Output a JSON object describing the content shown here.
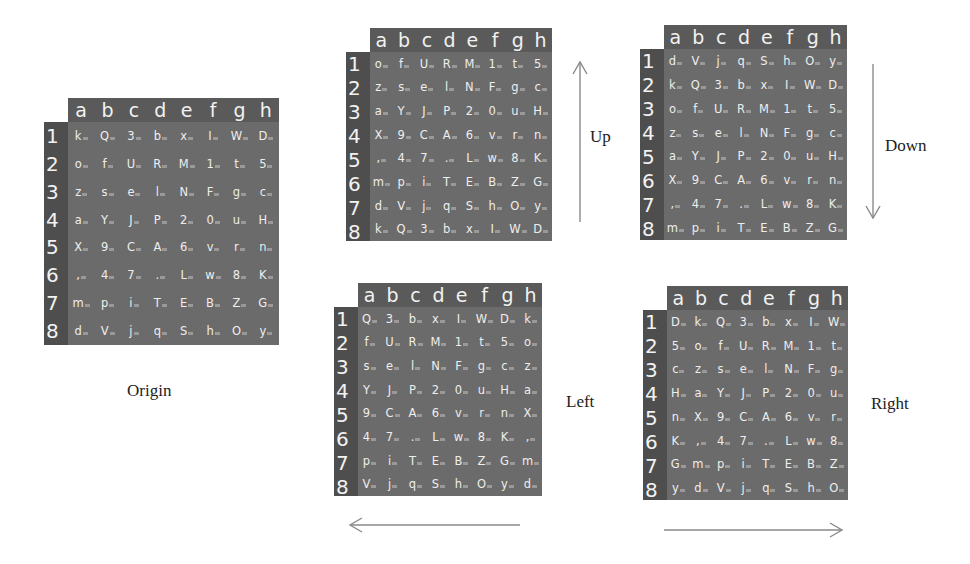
{
  "columns": [
    "a",
    "b",
    "c",
    "d",
    "e",
    "f",
    "g",
    "h"
  ],
  "row_labels": [
    "1",
    "2",
    "3",
    "4",
    "5",
    "6",
    "7",
    "8"
  ],
  "panels": {
    "origin": {
      "label": "Origin",
      "rows": [
        [
          "k",
          "Q",
          "3",
          "b",
          "x",
          "I",
          "W",
          "D"
        ],
        [
          "o",
          "f",
          "U",
          "R",
          "M",
          "1",
          "t",
          "5"
        ],
        [
          "z",
          "s",
          "e",
          "l",
          "N",
          "F",
          "g",
          "c"
        ],
        [
          "a",
          "Y",
          "J",
          "P",
          "2",
          "0",
          "u",
          "H"
        ],
        [
          "X",
          "9",
          "C",
          "A",
          "6",
          "v",
          "r",
          "n"
        ],
        [
          ",",
          "4",
          "7",
          ".",
          "L",
          "w",
          "8",
          "K"
        ],
        [
          "m",
          "p",
          "i",
          "T",
          "E",
          "B",
          "Z",
          "G"
        ],
        [
          "d",
          "V",
          "j",
          "q",
          "S",
          "h",
          "O",
          "y"
        ]
      ]
    },
    "up": {
      "label": "Up",
      "rows": [
        [
          "o",
          "f",
          "U",
          "R",
          "M",
          "1",
          "t",
          "5"
        ],
        [
          "z",
          "s",
          "e",
          "l",
          "N",
          "F",
          "g",
          "c"
        ],
        [
          "a",
          "Y",
          "J",
          "P",
          "2",
          "0",
          "u",
          "H"
        ],
        [
          "X",
          "9",
          "C",
          "A",
          "6",
          "v",
          "r",
          "n"
        ],
        [
          ",",
          "4",
          "7",
          ".",
          "L",
          "w",
          "8",
          "K"
        ],
        [
          "m",
          "p",
          "i",
          "T",
          "E",
          "B",
          "Z",
          "G"
        ],
        [
          "d",
          "V",
          "j",
          "q",
          "S",
          "h",
          "O",
          "y"
        ],
        [
          "k",
          "Q",
          "3",
          "b",
          "x",
          "I",
          "W",
          "D"
        ]
      ]
    },
    "down": {
      "label": "Down",
      "rows": [
        [
          "d",
          "V",
          "j",
          "q",
          "S",
          "h",
          "O",
          "y"
        ],
        [
          "k",
          "Q",
          "3",
          "b",
          "x",
          "I",
          "W",
          "D"
        ],
        [
          "o",
          "f",
          "U",
          "R",
          "M",
          "1",
          "t",
          "5"
        ],
        [
          "z",
          "s",
          "e",
          "l",
          "N",
          "F",
          "g",
          "c"
        ],
        [
          "a",
          "Y",
          "J",
          "P",
          "2",
          "0",
          "u",
          "H"
        ],
        [
          "X",
          "9",
          "C",
          "A",
          "6",
          "v",
          "r",
          "n"
        ],
        [
          ",",
          "4",
          "7",
          ".",
          "L",
          "w",
          "8",
          "K"
        ],
        [
          "m",
          "p",
          "i",
          "T",
          "E",
          "B",
          "Z",
          "G"
        ]
      ]
    },
    "left": {
      "label": "Left",
      "rows": [
        [
          "Q",
          "3",
          "b",
          "x",
          "I",
          "W",
          "D",
          "k"
        ],
        [
          "f",
          "U",
          "R",
          "M",
          "1",
          "t",
          "5",
          "o"
        ],
        [
          "s",
          "e",
          "l",
          "N",
          "F",
          "g",
          "c",
          "z"
        ],
        [
          "Y",
          "J",
          "P",
          "2",
          "0",
          "u",
          "H",
          "a"
        ],
        [
          "9",
          "C",
          "A",
          "6",
          "v",
          "r",
          "n",
          "X"
        ],
        [
          "4",
          "7",
          ".",
          "L",
          "w",
          "8",
          "K",
          ","
        ],
        [
          "p",
          "i",
          "T",
          "E",
          "B",
          "Z",
          "G",
          "m"
        ],
        [
          "V",
          "j",
          "q",
          "S",
          "h",
          "O",
          "y",
          "d"
        ]
      ]
    },
    "right": {
      "label": "Right",
      "rows": [
        [
          "D",
          "k",
          "Q",
          "3",
          "b",
          "x",
          "I",
          "W"
        ],
        [
          "5",
          "o",
          "f",
          "U",
          "R",
          "M",
          "1",
          "t"
        ],
        [
          "c",
          "z",
          "s",
          "e",
          "l",
          "N",
          "F",
          "g"
        ],
        [
          "H",
          "a",
          "Y",
          "J",
          "P",
          "2",
          "0",
          "u"
        ],
        [
          "n",
          "X",
          "9",
          "C",
          "A",
          "6",
          "v",
          "r"
        ],
        [
          "K",
          ",",
          "4",
          "7",
          ".",
          "L",
          "w",
          "8"
        ],
        [
          "G",
          "m",
          "p",
          "i",
          "T",
          "E",
          "B",
          "Z"
        ],
        [
          "y",
          "d",
          "V",
          "j",
          "q",
          "S",
          "h",
          "O"
        ]
      ]
    }
  },
  "arrows": {
    "up": "arrow-up",
    "down": "arrow-down",
    "left": "arrow-left",
    "right": "arrow-right"
  },
  "colors": {
    "grid_body": "#6b6b6b",
    "grid_header": "#5a5a5a",
    "row_labels": "#4e4e4e",
    "text": "#eeeeee",
    "arrow": "#8a8a8a"
  }
}
